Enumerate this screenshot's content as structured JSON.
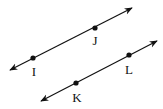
{
  "diagram": {
    "type": "parallel-lines",
    "line_color": "#111111",
    "lines": [
      {
        "name": "line-IJ",
        "start": [
          10,
          70
        ],
        "end": [
          132,
          8
        ],
        "points": [
          {
            "label": "I",
            "pos": [
              33,
              58
            ],
            "label_pos": [
              34,
              76
            ]
          },
          {
            "label": "J",
            "pos": [
              95,
              28
            ],
            "label_pos": [
              95,
              45
            ]
          }
        ]
      },
      {
        "name": "line-KL",
        "start": [
          41,
          101
        ],
        "end": [
          157,
          41
        ],
        "points": [
          {
            "label": "K",
            "pos": [
              76,
              83
            ],
            "label_pos": [
              77,
              102
            ]
          },
          {
            "label": "L",
            "pos": [
              129,
              55
            ],
            "label_pos": [
              129,
              74
            ]
          }
        ]
      }
    ]
  }
}
